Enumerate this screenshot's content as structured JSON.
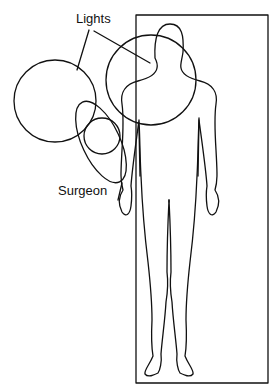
{
  "diagram": {
    "labels": {
      "lights": "Lights",
      "surgeon": "Surgeon"
    },
    "elements": [
      {
        "name": "operating-table",
        "shape": "rectangle"
      },
      {
        "name": "patient-outline",
        "shape": "human-figure"
      },
      {
        "name": "light-left",
        "shape": "circle"
      },
      {
        "name": "light-right",
        "shape": "circle"
      },
      {
        "name": "surgeon-shoulders",
        "shape": "ellipse"
      },
      {
        "name": "surgeon-head",
        "shape": "circle"
      }
    ],
    "stroke_color": "#111111",
    "background": "#ffffff"
  }
}
